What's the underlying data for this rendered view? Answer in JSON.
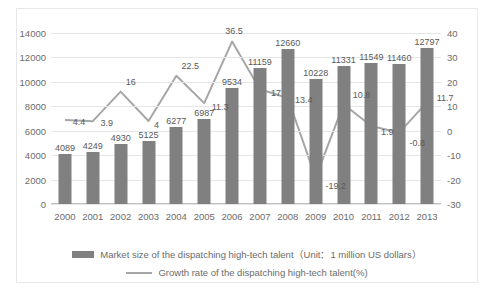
{
  "chart_data": {
    "type": "bar",
    "title": "",
    "xlabel": "",
    "ylabel": "",
    "grid": true,
    "legend_position": "bottom",
    "categories": [
      "2000",
      "2001",
      "2002",
      "2003",
      "2004",
      "2005",
      "2006",
      "2007",
      "2008",
      "2009",
      "2010",
      "2011",
      "2012",
      "2013"
    ],
    "ylim": [
      0,
      14000
    ],
    "yticks": [
      "0",
      "2000",
      "4000",
      "6000",
      "8000",
      "10000",
      "12000",
      "14000"
    ],
    "y2lim": [
      -30,
      40
    ],
    "y2ticks": [
      "-30",
      "-20",
      "-10",
      "0",
      "10",
      "20",
      "30",
      "40"
    ],
    "series": [
      {
        "name": "Market size of the dispatching high-tech talent（Unit：1 million US dollars）",
        "type": "bar",
        "axis": "left",
        "color": "#808080",
        "values": [
          4089,
          4249,
          4930,
          5125,
          6277,
          6987,
          9534,
          11159,
          12660,
          10228,
          11331,
          11549,
          11460,
          12797
        ],
        "labels": [
          "4089",
          "4249",
          "4930",
          "5125",
          "6277",
          "6987",
          "9534",
          "11159",
          "12660",
          "10228",
          "11331",
          "11549",
          "11460",
          "12797"
        ]
      },
      {
        "name": "Growth rate of the dispatching high-tech talent(%)",
        "type": "line",
        "axis": "right",
        "color": "#a6a6a6",
        "values": [
          4.4,
          3.9,
          16,
          4,
          22.5,
          11.3,
          36.5,
          17,
          13.4,
          -19.2,
          10.8,
          1.9,
          -0.8,
          11.7
        ],
        "labels": [
          "4.4",
          "3.9",
          "16",
          "4",
          "22.5",
          "11.3",
          "36.5",
          "17",
          "13.4",
          "-19.2",
          "10.8",
          "1.9",
          "-0.8",
          "11.7"
        ]
      }
    ]
  },
  "legend": {
    "bar_label": "Market size of the dispatching high-tech talent（Unit：1 million US dollars）",
    "line_label": "Growth rate of the dispatching high-tech talent(%)"
  }
}
